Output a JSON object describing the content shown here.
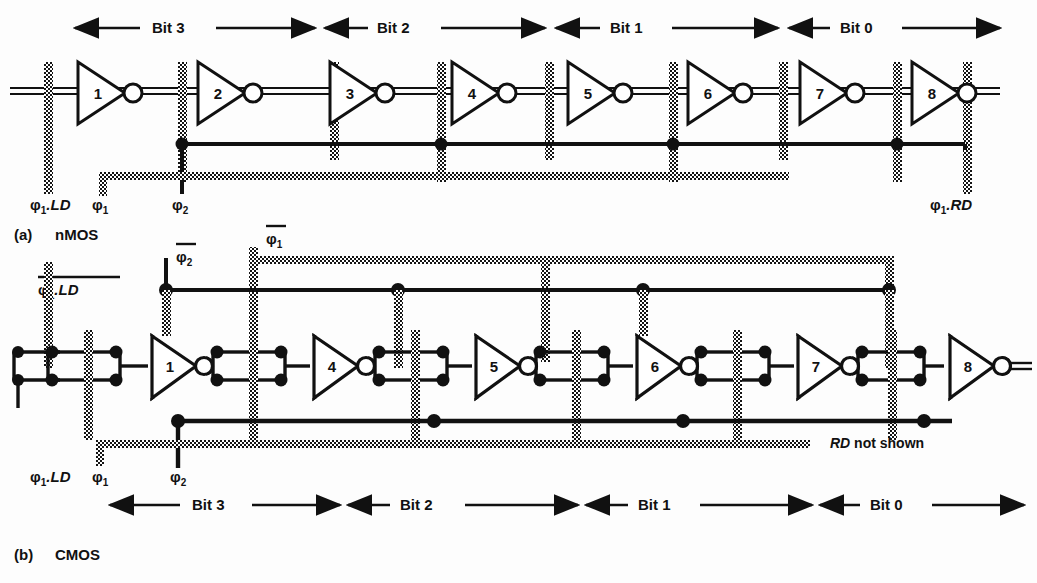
{
  "figure": {
    "background_color": "#fdfdfd",
    "ink_color": "#111111",
    "poly_bar_color": "#1a1a1a"
  },
  "sections": [
    {
      "id": "a",
      "caption_index": "(a)",
      "caption_text": "nMOS",
      "technology": "nMOS",
      "inverter_count": 8,
      "inverter_labels": [
        "1",
        "2",
        "3",
        "4",
        "5",
        "6",
        "7",
        "8"
      ],
      "bit_band_position": "top",
      "bit_labels": [
        "Bit 3",
        "Bit 2",
        "Bit 1",
        "Bit 0"
      ],
      "clock_labels": [
        {
          "name": "phi1-LD",
          "base": "φ",
          "sub": "1",
          "suffix": ".LD",
          "overbar": false,
          "italic_suffix": true
        },
        {
          "name": "phi1",
          "base": "φ",
          "sub": "1",
          "suffix": "",
          "overbar": false,
          "italic_suffix": false
        },
        {
          "name": "phi2",
          "base": "φ",
          "sub": "2",
          "suffix": "",
          "overbar": false,
          "italic_suffix": false
        },
        {
          "name": "phi1-RD",
          "base": "φ",
          "sub": "1",
          "suffix": ".RD",
          "overbar": false,
          "italic_suffix": true
        }
      ]
    },
    {
      "id": "b",
      "caption_index": "(b)",
      "caption_text": "CMOS",
      "technology": "CMOS",
      "inverter_count": 8,
      "inverter_labels": [
        "1",
        "2",
        "3",
        "4",
        "5",
        "6",
        "7",
        "8"
      ],
      "bit_band_position": "bottom",
      "bit_labels": [
        "Bit 3",
        "Bit 2",
        "Bit 1",
        "Bit 0"
      ],
      "annotation": "RD not shown",
      "annotation_italic_part": "RD",
      "clock_labels_top": [
        {
          "name": "phi1-LD-bar",
          "base": "φ",
          "sub": "1",
          "suffix": ".LD",
          "overbar": true,
          "italic_suffix": true
        },
        {
          "name": "phi2-bar",
          "base": "φ",
          "sub": "2",
          "suffix": "",
          "overbar": true,
          "italic_suffix": false
        },
        {
          "name": "phi1-bar",
          "base": "φ",
          "sub": "1",
          "suffix": "",
          "overbar": true,
          "italic_suffix": false
        }
      ],
      "clock_labels_bottom": [
        {
          "name": "phi1-LD",
          "base": "φ",
          "sub": "1",
          "suffix": ".LD",
          "overbar": false,
          "italic_suffix": true
        },
        {
          "name": "phi1",
          "base": "φ",
          "sub": "1",
          "suffix": "",
          "overbar": false,
          "italic_suffix": false
        },
        {
          "name": "phi2",
          "base": "φ",
          "sub": "2",
          "suffix": "",
          "overbar": false,
          "italic_suffix": false
        }
      ]
    }
  ],
  "text": {
    "caption_a_index": "(a)",
    "caption_a": "nMOS",
    "caption_b_index": "(b)",
    "caption_b": "CMOS",
    "bit3": "Bit 3",
    "bit2": "Bit 2",
    "bit1": "Bit 1",
    "bit0": "Bit 0",
    "rd_not_shown_italic": "RD",
    "rd_not_shown_rest": " not shown",
    "phi": "φ",
    "sub1": "1",
    "sub2": "2",
    "dot_ld": ".LD",
    "dot_rd": ".RD",
    "inv1": "1",
    "inv2": "2",
    "inv3": "3",
    "inv4": "4",
    "inv5": "5",
    "inv6": "6",
    "inv7": "7",
    "inv8": "8"
  }
}
